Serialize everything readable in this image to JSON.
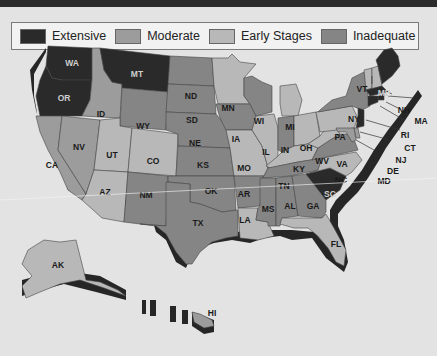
{
  "legend": {
    "items": [
      {
        "key": "extensive",
        "label": "Extensive",
        "color": "#2a2a2a"
      },
      {
        "key": "moderate",
        "label": "Moderate",
        "color": "#9c9c9c"
      },
      {
        "key": "early",
        "label": "Early Stages",
        "color": "#b8b8b8"
      },
      {
        "key": "inadequate",
        "label": "Inadequate",
        "color": "#858585"
      }
    ]
  },
  "colors": {
    "background": "#e3e3e3",
    "shadow": "#262626",
    "border": "#444444"
  },
  "states": {
    "WA": "extensive",
    "OR": "extensive",
    "MT": "extensive",
    "ID": "moderate",
    "CA": "moderate",
    "NV": "moderate",
    "WY": "inadequate",
    "UT": "early",
    "CO": "early",
    "AZ": "early",
    "NM": "inadequate",
    "ND": "inadequate",
    "SD": "inadequate",
    "NE": "inadequate",
    "KS": "inadequate",
    "OK": "inadequate",
    "TX": "inadequate",
    "MN": "early",
    "IA": "inadequate",
    "MO": "early",
    "AR": "inadequate",
    "LA": "early",
    "WI": "inadequate",
    "IL": "early",
    "MI": "early",
    "IN": "inadequate",
    "OH": "early",
    "KY": "early",
    "TN": "inadequate",
    "MS": "inadequate",
    "AL": "inadequate",
    "GA": "inadequate",
    "FL": "early",
    "SC": "extensive",
    "NC": "early",
    "VA": "inadequate",
    "WV": "early",
    "PA": "early",
    "NY": "inadequate",
    "VT": "early",
    "NH": "early",
    "ME": "extensive",
    "MA": "extensive",
    "RI": "extensive",
    "CT": "extensive",
    "NJ": "extensive",
    "DE": "moderate",
    "MD": "moderate",
    "AK": "early",
    "HI": "moderate"
  },
  "labels": {
    "WA": "WA",
    "OR": "OR",
    "MT": "MT",
    "ID": "ID",
    "CA": "CA",
    "NV": "NV",
    "WY": "WY",
    "UT": "UT",
    "CO": "CO",
    "AZ": "AZ",
    "NM": "NM",
    "ND": "ND",
    "SD": "SD",
    "NE": "NE",
    "KS": "KS",
    "OK": "OK",
    "TX": "TX",
    "MN": "MN",
    "IA": "IA",
    "MO": "MO",
    "AR": "AR",
    "LA": "LA",
    "WI": "WI",
    "IL": "IL",
    "MI": "MI",
    "IN": "IN",
    "OH": "OH",
    "KY": "KY",
    "TN": "TN",
    "MS": "MS",
    "AL": "AL",
    "GA": "GA",
    "FL": "FL",
    "SC": "SC",
    "NC": "NC",
    "VA": "VA",
    "WV": "WV",
    "PA": "PA",
    "NY": "NY",
    "VT": "VT",
    "NH": "NH",
    "ME": "ME",
    "MA": "MA",
    "RI": "RI",
    "CT": "CT",
    "NJ": "NJ",
    "DE": "DE",
    "MD": "MD",
    "AK": "AK",
    "HI": "HI"
  }
}
